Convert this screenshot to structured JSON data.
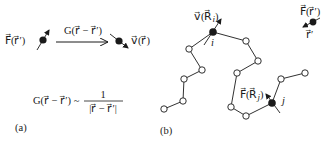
{
  "panel_a": {
    "label": "(a)",
    "source_label": "F⃗(r⃗′)",
    "propagator_label": "G(r⃗ − r⃗′)",
    "target_label": "v⃗(r⃗)",
    "equation_lhs": "G(r⃗ − r⃗′) ~",
    "equation_numerator": "1",
    "equation_denominator": "|r⃗ − r⃗′|"
  },
  "panel_b": {
    "label": "(b)",
    "velocity_label": "v⃗(R⃗",
    "velocity_sub": "i",
    "velocity_close": ")",
    "force_label": "F⃗(R⃗",
    "force_sub": "j",
    "force_close": ")",
    "node_i_label": "i",
    "node_j_label": "j",
    "point_force_label": "F⃗(r⃗′)",
    "point_position_label": "r⃗′"
  },
  "colors": {
    "ink": "#1a1a1a",
    "background": "#ffffff"
  }
}
